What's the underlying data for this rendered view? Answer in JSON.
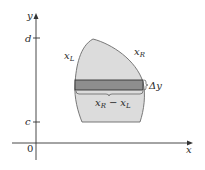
{
  "diagram": {
    "type": "region-between-curves-horizontal-strip",
    "colors": {
      "region_fill": "#dcdcdc",
      "region_stroke": "#6a6a6a",
      "strip_fill": "#8e8e8e",
      "strip_stroke": "#333333",
      "axis": "#333333",
      "text": "#2a2a2a"
    },
    "axes": {
      "x_label": "x",
      "y_label": "y",
      "origin_label": "0"
    },
    "ticks": {
      "d_label": "d",
      "c_label": "c"
    },
    "curves": {
      "left_label_main": "x",
      "left_label_sub": "L",
      "right_label_main": "x",
      "right_label_sub": "R"
    },
    "strip": {
      "height_label": "Δy",
      "width_label": {
        "a_main": "x",
        "a_sub": "R",
        "op": "−",
        "b_main": "x",
        "b_sub": "L"
      }
    }
  }
}
